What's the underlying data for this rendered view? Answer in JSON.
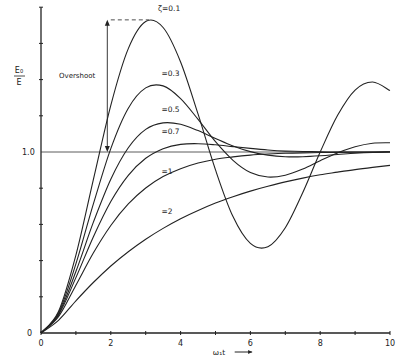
{
  "chart_data": {
    "type": "line",
    "title": "",
    "xlabel": "ω₁t",
    "ylabel_num": "E₀",
    "ylabel_den": "E",
    "xlim": [
      0,
      10
    ],
    "ylim": [
      0,
      1.8
    ],
    "grid": false,
    "x_ticks": [
      0,
      2,
      4,
      6,
      8,
      10
    ],
    "x_tick_labels": [
      "0",
      "2",
      "4",
      "6",
      "8",
      "10"
    ],
    "x_minor_ticks": [
      1,
      3,
      5,
      7,
      9
    ],
    "y_ticks": [
      0.2,
      0.4,
      0.6,
      0.8,
      1.2,
      1.4,
      1.6,
      1.8
    ],
    "y_tick_labels": {
      "0": "0",
      "1.0": "1.0"
    },
    "reference_line": {
      "y": 1.0
    },
    "annotations": [
      {
        "text": "Overshoot",
        "type": "double-arrow",
        "from_y": 1.0,
        "to_y": 1.73,
        "x": 1.9
      },
      {
        "text": "- - -",
        "type": "dashed-line",
        "y": 1.73,
        "x_from": 2.0,
        "x_to": 3.1
      }
    ],
    "x": [
      0,
      0.5,
      1,
      1.5,
      2,
      2.5,
      3,
      3.5,
      4,
      4.5,
      5,
      5.5,
      6,
      6.5,
      7,
      7.5,
      8,
      8.5,
      9,
      9.5,
      10
    ],
    "series": [
      {
        "name": "ζ=0.1",
        "label": "ζ=0.1",
        "label_pos": [
          3.35,
          1.78
        ],
        "values": [
          0,
          0.118,
          0.43,
          0.846,
          1.258,
          1.571,
          1.721,
          1.688,
          1.497,
          1.209,
          0.901,
          0.643,
          0.495,
          0.477,
          0.582,
          0.776,
          1.0,
          1.203,
          1.342,
          1.387,
          1.339
        ]
      },
      {
        "name": "ζ=0.3",
        "label": "=0.3",
        "label_pos": [
          3.45,
          1.42
        ],
        "values": [
          0,
          0.111,
          0.382,
          0.712,
          1.019,
          1.242,
          1.354,
          1.365,
          1.295,
          1.18,
          1.057,
          0.954,
          0.887,
          0.862,
          0.872,
          0.906,
          0.952,
          0.995,
          1.029,
          1.048,
          1.051
        ]
      },
      {
        "name": "ζ=0.5",
        "label": "=0.5",
        "label_pos": [
          3.45,
          1.22
        ],
        "values": [
          0,
          0.104,
          0.34,
          0.611,
          0.849,
          1.023,
          1.125,
          1.161,
          1.153,
          1.118,
          1.075,
          1.033,
          1.002,
          0.983,
          0.974,
          0.974,
          0.979,
          0.986,
          0.993,
          0.998,
          1.001
        ]
      },
      {
        "name": "ζ=0.7",
        "label": "=0.7",
        "label_pos": [
          3.45,
          1.1
        ],
        "values": [
          0,
          0.099,
          0.306,
          0.531,
          0.726,
          0.871,
          0.965,
          1.018,
          1.042,
          1.046,
          1.04,
          1.03,
          1.02,
          1.011,
          1.005,
          1.003,
          1.001,
          1.0,
          1.0,
          1.0,
          1.0
        ]
      },
      {
        "name": "ζ=1",
        "label": "=1",
        "label_pos": [
          3.45,
          0.88
        ],
        "values": [
          0,
          0.09,
          0.264,
          0.442,
          0.594,
          0.713,
          0.801,
          0.864,
          0.908,
          0.939,
          0.96,
          0.973,
          0.983,
          0.989,
          0.993,
          0.995,
          0.997,
          0.998,
          0.999,
          0.999,
          1.0
        ]
      },
      {
        "name": "ζ=2",
        "label": "=2",
        "label_pos": [
          3.45,
          0.66
        ],
        "values": [
          0,
          0.07,
          0.178,
          0.279,
          0.37,
          0.449,
          0.518,
          0.578,
          0.631,
          0.677,
          0.718,
          0.753,
          0.784,
          0.811,
          0.835,
          0.856,
          0.874,
          0.889,
          0.903,
          0.915,
          0.926
        ]
      }
    ]
  },
  "labels": {
    "overshoot": "Overshoot",
    "y_one": "1.0",
    "y_zero": "0",
    "x_axis_arrow": "→"
  }
}
